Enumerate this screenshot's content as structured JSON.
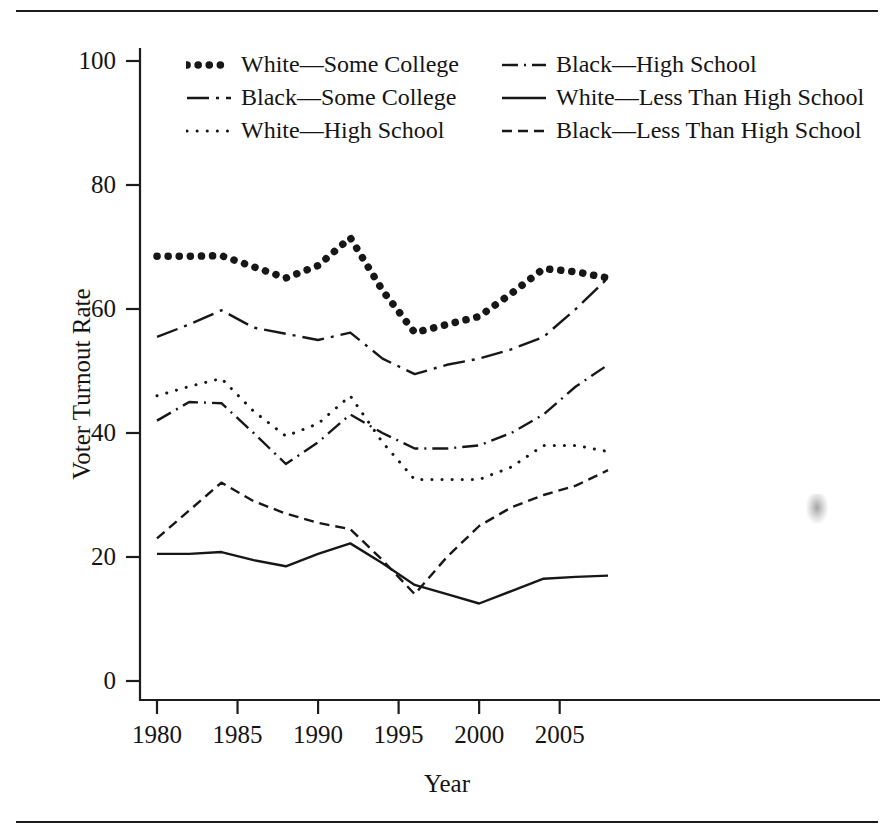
{
  "figure": {
    "top_rule": "horizontal-rule",
    "bottom_rule": "horizontal-rule"
  },
  "chart_data": {
    "type": "line",
    "title": "",
    "xlabel": "Year",
    "ylabel": "Voter Turnout Rate",
    "xlim": [
      1980,
      2008
    ],
    "ylim": [
      0,
      105
    ],
    "xticks": [
      1980,
      1985,
      1990,
      1995,
      2000,
      2005
    ],
    "yticks": [
      0,
      20,
      40,
      60,
      80,
      100
    ],
    "grid": false,
    "legend_position": "top-center",
    "x": [
      1980,
      1982,
      1984,
      1986,
      1988,
      1990,
      1992,
      1994,
      1996,
      1998,
      2000,
      2002,
      2004,
      2006,
      2008
    ],
    "series": [
      {
        "name": "White—Some College",
        "style": "thick-dotted",
        "values": [
          68.5,
          68.5,
          68.6,
          66.8,
          65.0,
          67.0,
          71.5,
          63.0,
          56.2,
          57.5,
          58.8,
          62.5,
          66.5,
          66.0,
          65.0
        ]
      },
      {
        "name": "Black—Some College",
        "style": "dash-dot",
        "values": [
          55.5,
          57.5,
          59.8,
          57.0,
          56.0,
          55.0,
          56.2,
          52.0,
          49.5,
          51.0,
          52.0,
          53.5,
          55.5,
          60.0,
          65.0
        ]
      },
      {
        "name": "White—High School",
        "style": "fine-dotted",
        "values": [
          46.0,
          47.5,
          48.8,
          43.5,
          39.5,
          41.5,
          46.0,
          38.5,
          32.5,
          32.5,
          32.5,
          34.5,
          38.0,
          38.0,
          37.0
        ]
      },
      {
        "name": "Black—High School",
        "style": "dash-dot-fine",
        "values": [
          42.0,
          45.0,
          44.8,
          40.0,
          35.0,
          38.5,
          43.0,
          40.0,
          37.5,
          37.5,
          38.0,
          40.0,
          43.0,
          47.5,
          51.0
        ]
      },
      {
        "name": "Black—Less Than High School",
        "style": "dashed",
        "values": [
          23.0,
          27.5,
          32.0,
          29.0,
          27.0,
          25.5,
          24.5,
          19.5,
          14.0,
          20.0,
          25.0,
          28.0,
          30.0,
          31.5,
          34.0
        ]
      },
      {
        "name": "White—Less Than High School",
        "style": "solid",
        "values": [
          20.5,
          20.5,
          20.8,
          19.5,
          18.5,
          20.5,
          22.2,
          19.0,
          15.5,
          14.0,
          12.5,
          14.5,
          16.5,
          16.8,
          17.0
        ]
      }
    ]
  },
  "legend": {
    "rows": [
      [
        {
          "label": "White—Some College",
          "style": "thick-dotted"
        },
        {
          "label": "Black—High School",
          "style": "dash-dot-fine"
        }
      ],
      [
        {
          "label": "Black—Some College",
          "style": "dash-dot"
        },
        {
          "label": "White—Less Than High School",
          "style": "solid"
        }
      ],
      [
        {
          "label": "White—High School",
          "style": "fine-dotted"
        },
        {
          "label": "Black—Less Than High School",
          "style": "dashed"
        }
      ]
    ]
  },
  "axes": {
    "y_tick_labels": [
      "100",
      "80",
      "60",
      "40",
      "20",
      "0"
    ],
    "x_tick_labels": [
      "1980",
      "1985",
      "1990",
      "1995",
      "2000",
      "2005"
    ]
  }
}
